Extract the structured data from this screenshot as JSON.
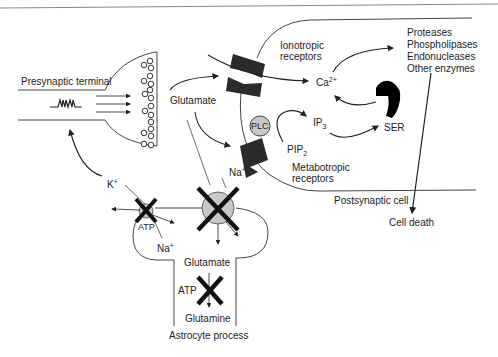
{
  "diagram": {
    "labels": {
      "presynaptic_terminal": "Presynaptic terminal",
      "glutamate_top": "Glutamate",
      "ionotropic_receptors_1": "Ionotropic",
      "ionotropic_receptors_2": "receptors",
      "calcium": "Ca",
      "calcium_sup": "2+",
      "ip3": "IP",
      "ip3_sub": "3",
      "pip2": "PIP",
      "pip2_sub": "2",
      "plc": "PLC",
      "ser": "SER",
      "metabotropic_receptors_1": "Metabotropic",
      "metabotropic_receptors_2": "receptors",
      "sodium_top": "Na",
      "sodium_top_sup": "+",
      "potassium": "K",
      "potassium_sup": "+",
      "atp_pump": "ATP",
      "sodium_bottom": "Na",
      "sodium_bottom_sup": "+",
      "glutamate_astro": "Glutamate",
      "atp_astro": "ATP",
      "glutamine": "Glutamine",
      "astrocyte_process": "Astrocyte process",
      "postsynaptic_cell": "Postsynaptic cell",
      "cell_death": "Cell death"
    },
    "enzymes": [
      "Proteases",
      "Phospholipases",
      "Endonucleases",
      "Other enzymes"
    ],
    "colors": {
      "line": "#333333",
      "receptor_fill": "#2b2b2b",
      "transporter_fill": "#c8c8c8",
      "cross": "#111111"
    }
  }
}
